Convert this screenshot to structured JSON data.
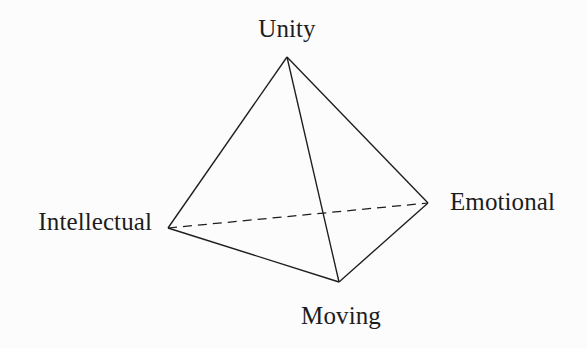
{
  "figure": {
    "type": "tetrahedron-wireframe-diagram",
    "background_color": "#fcfcfc",
    "line_color": "#1d1d1d",
    "text_color": "#1d1d1d",
    "width": 587,
    "height": 348
  },
  "vertices": [
    {
      "id": "unity",
      "label": "Unity",
      "x": 287,
      "y": 57,
      "label_position": "above"
    },
    {
      "id": "intellectual",
      "label": "Intellectual",
      "x": 168,
      "y": 228,
      "label_position": "left"
    },
    {
      "id": "emotional",
      "label": "Emotional",
      "x": 428,
      "y": 203,
      "label_position": "right"
    },
    {
      "id": "moving",
      "label": "Moving",
      "x": 339,
      "y": 282,
      "label_position": "below"
    }
  ],
  "edges": [
    {
      "id": "unity-intellectual",
      "from": "unity",
      "to": "intellectual",
      "style": "solid"
    },
    {
      "id": "unity-moving",
      "from": "unity",
      "to": "moving",
      "style": "solid"
    },
    {
      "id": "unity-emotional",
      "from": "unity",
      "to": "emotional",
      "style": "solid"
    },
    {
      "id": "intellectual-moving",
      "from": "intellectual",
      "to": "moving",
      "style": "solid"
    },
    {
      "id": "moving-emotional",
      "from": "moving",
      "to": "emotional",
      "style": "solid"
    },
    {
      "id": "intellectual-emotional",
      "from": "intellectual",
      "to": "emotional",
      "style": "dashed"
    }
  ],
  "labels": {
    "unity": "Unity",
    "intellectual": "Intellectual",
    "emotional": "Emotional",
    "moving": "Moving"
  }
}
